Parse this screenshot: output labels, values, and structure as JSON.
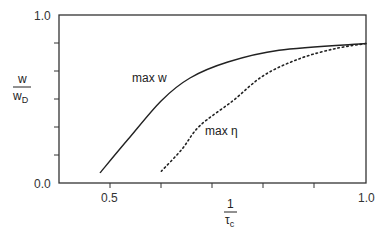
{
  "chart_data": {
    "type": "line",
    "title": "",
    "xlabel": "1/τ_c",
    "ylabel": "w/w_D",
    "xlim": [
      0.4,
      1.0
    ],
    "ylim": [
      0.0,
      1.0
    ],
    "grid": false,
    "legend": "inline labels",
    "x_ticks": [
      0.5,
      0.6,
      0.7,
      0.8,
      0.9,
      1.0
    ],
    "x_tick_labels": [
      "0.5",
      "1.0"
    ],
    "y_ticks": [
      0.0,
      0.2,
      0.4,
      0.6,
      0.8,
      1.0
    ],
    "y_tick_labels": [
      "0.0",
      "1.0"
    ],
    "series": [
      {
        "name": "max w",
        "style": "solid",
        "x": [
          0.48,
          0.535,
          0.6,
          0.656,
          0.73,
          0.83,
          1.0
        ],
        "y": [
          0.06,
          0.26,
          0.49,
          0.625,
          0.72,
          0.79,
          0.83
        ]
      },
      {
        "name": "max η",
        "style": "dotted",
        "x": [
          0.6,
          0.64,
          0.675,
          0.74,
          0.8,
          0.87,
          0.94,
          1.0
        ],
        "y": [
          0.07,
          0.2,
          0.34,
          0.49,
          0.64,
          0.74,
          0.8,
          0.83
        ]
      }
    ]
  },
  "labels": {
    "y_axis_num": "w",
    "y_axis_den_main": "w",
    "y_axis_den_sub": "D",
    "x_axis_num": "1",
    "x_axis_den_main": "τ",
    "x_axis_den_sub": "c",
    "y_top": "1.0",
    "y_bottom": "0.0",
    "x_left": "0.5",
    "x_right": "1.0",
    "series_w": "max w",
    "series_eta": "max η"
  }
}
